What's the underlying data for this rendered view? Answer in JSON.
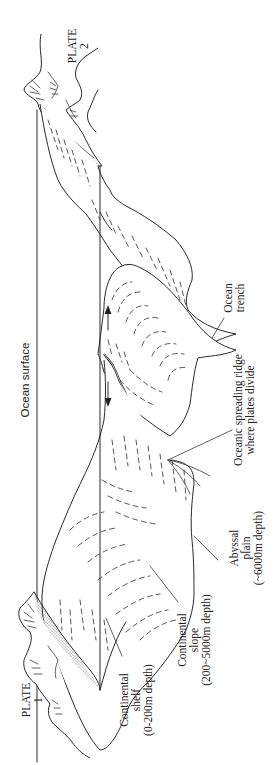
{
  "figure": {
    "orientation": "rotated 90deg counter-clockwise",
    "style": "black line illustration on white",
    "colors": {
      "line": "#2a2a2a",
      "background": "#ffffff",
      "stipple": "#555555"
    }
  },
  "labels": {
    "plate_1": {
      "line1": "PLATE",
      "line2": "1"
    },
    "plate_2": {
      "line1": "PLATE",
      "line2": "2"
    },
    "ocean_surface": "Ocean surface",
    "continental_shelf": {
      "line1": "Continental",
      "line2": "shelf",
      "line3": "(0-200m depth)"
    },
    "continental_slope": {
      "line1": "Continental",
      "line2": "slope",
      "line3": "(200~5000m depth)"
    },
    "abyssal_plain": {
      "line1": "Abyssal",
      "line2": "plain",
      "line3": "(~6000m depth)"
    },
    "spreading_ridge": {
      "line1": "Oceanic spreading ridge",
      "line2": "where plates divide"
    },
    "ocean_trench": {
      "line1": "Ocean",
      "line2": "trench"
    }
  },
  "arrows": [
    {
      "name": "plate-2-motion",
      "direction": "toward plate 2"
    },
    {
      "name": "plate-1-motion",
      "direction": "toward plate 1"
    }
  ]
}
